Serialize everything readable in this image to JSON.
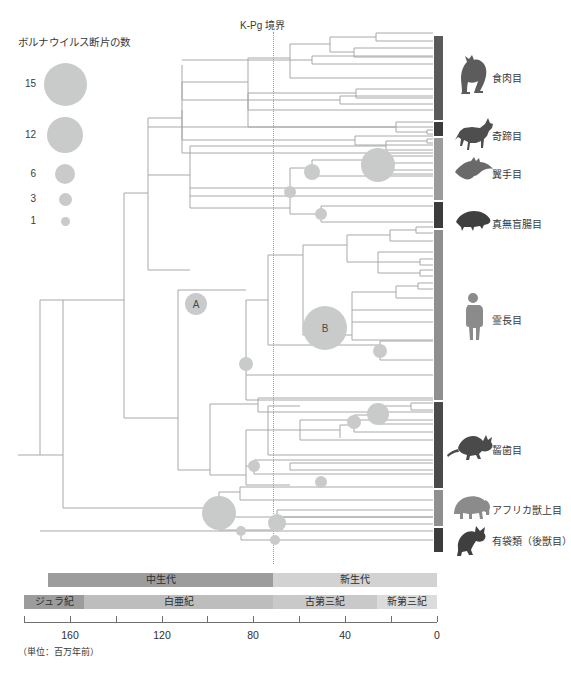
{
  "legend": {
    "title": "ボルナウイルス断片の数",
    "items": [
      {
        "label": "15",
        "value": 15,
        "radius": 21.5,
        "cy": 84
      },
      {
        "label": "12",
        "value": 12,
        "radius": 18.0,
        "cy": 135
      },
      {
        "label": "6",
        "value": 6,
        "radius": 10.0,
        "cy": 174
      },
      {
        "label": "3",
        "value": 3,
        "radius": 6.5,
        "cy": 199
      },
      {
        "label": "1",
        "value": 1,
        "radius": 4.5,
        "cy": 221
      }
    ],
    "bubble_color": "#c9cbca",
    "bubble_cx": 65
  },
  "boundary": {
    "label": "K-Pg 境界",
    "x": 273,
    "color": "#9b9b9b"
  },
  "taxa": [
    {
      "name": "食肉目",
      "bar_top": 36,
      "bar_height": 84,
      "color": "#5a5a5a",
      "label_x": 492,
      "label_y": 76,
      "icon": "cat-icon",
      "icon_x": 458,
      "icon_y": 58
    },
    {
      "name": "奇蹄目",
      "bar_top": 122,
      "bar_height": 14,
      "color": "#3c3c3c",
      "label_x": 492,
      "label_y": 134,
      "icon": "horse-icon",
      "icon_x": 455,
      "icon_y": 124
    },
    {
      "name": "翼手目",
      "bar_top": 138,
      "bar_height": 62,
      "color": "#9b9b9b",
      "label_x": 492,
      "label_y": 172,
      "icon": "bat-icon",
      "icon_x": 455,
      "icon_y": 160
    },
    {
      "name": "真無盲腸目",
      "bar_top": 202,
      "bar_height": 26,
      "color": "#3c3c3c",
      "label_x": 492,
      "label_y": 222,
      "icon": "shrew-icon",
      "icon_x": 455,
      "icon_y": 210
    },
    {
      "name": "霊長目",
      "bar_top": 230,
      "bar_height": 170,
      "color": "#8f8f8f",
      "label_x": 492,
      "label_y": 318,
      "icon": "human-icon",
      "icon_x": 466,
      "icon_y": 292
    },
    {
      "name": "齧歯目",
      "bar_top": 402,
      "bar_height": 86,
      "color": "#4a4a4a",
      "label_x": 492,
      "label_y": 448,
      "icon": "mouse-icon",
      "icon_x": 456,
      "icon_y": 434
    },
    {
      "name": "アフリカ獣上目",
      "bar_top": 490,
      "bar_height": 36,
      "color": "#8f8f8f",
      "label_x": 492,
      "label_y": 508,
      "icon": "elephant-icon",
      "icon_x": 453,
      "icon_y": 494
    },
    {
      "name": "有袋類（後獣目）",
      "bar_top": 528,
      "bar_height": 24,
      "color": "#3c3c3c",
      "label_x": 492,
      "label_y": 539,
      "icon": "koala-icon",
      "icon_x": 456,
      "icon_y": 526
    }
  ],
  "internal_nodes": [
    {
      "label": "A",
      "x": 196,
      "y": 304,
      "r": 11
    },
    {
      "label": "B",
      "x": 325,
      "y": 328,
      "r": 22
    }
  ],
  "timescale": {
    "eras": [
      {
        "name": "中生代",
        "x": 48,
        "width": 225,
        "color": "#9c9c9c"
      },
      {
        "name": "新生代",
        "x": 273,
        "width": 164,
        "color": "#d2d2d2"
      }
    ],
    "periods": [
      {
        "name": "ジュラ紀",
        "x": 24,
        "width": 60,
        "color": "#9c9c9c"
      },
      {
        "name": "白亜紀",
        "x": 84,
        "width": 189,
        "color": "#bdbdbd"
      },
      {
        "name": "古第三紀",
        "x": 273,
        "width": 104,
        "color": "#c9c9c9"
      },
      {
        "name": "新第三紀",
        "x": 377,
        "width": 60,
        "color": "#dcdcdc"
      }
    ],
    "era_row_y": 573,
    "period_row_y": 595
  },
  "axis": {
    "ticks": [
      {
        "value": 180,
        "x": 24,
        "label": ""
      },
      {
        "value": 160,
        "x": 70,
        "label": "160"
      },
      {
        "value": 140,
        "x": 116,
        "label": ""
      },
      {
        "value": 120,
        "x": 162,
        "label": "120"
      },
      {
        "value": 100,
        "x": 207,
        "label": ""
      },
      {
        "value": 80,
        "x": 253,
        "label": "80"
      },
      {
        "value": 60,
        "x": 299,
        "label": ""
      },
      {
        "value": 40,
        "x": 345,
        "label": "40"
      },
      {
        "value": 20,
        "x": 391,
        "label": ""
      },
      {
        "value": 0,
        "x": 437,
        "label": "0"
      }
    ],
    "unit_note": "（単位：百万年前）",
    "range": [
      180,
      0
    ],
    "pixel_range": [
      24,
      437
    ]
  },
  "tree": {
    "line_color": "#a8a8a8",
    "bubble_color": "#c9cbca",
    "root_x": 18,
    "tip_x": 433,
    "bubbles": [
      {
        "x": 312,
        "y": 172,
        "r": 8
      },
      {
        "x": 378,
        "y": 165,
        "r": 17
      },
      {
        "x": 290,
        "y": 192,
        "r": 6
      },
      {
        "x": 321,
        "y": 214,
        "r": 6
      },
      {
        "x": 246,
        "y": 364,
        "r": 7
      },
      {
        "x": 380,
        "y": 351,
        "r": 7
      },
      {
        "x": 378,
        "y": 414,
        "r": 11
      },
      {
        "x": 354,
        "y": 422,
        "r": 7
      },
      {
        "x": 254,
        "y": 466,
        "r": 6
      },
      {
        "x": 321,
        "y": 482,
        "r": 6
      },
      {
        "x": 219,
        "y": 513,
        "r": 17
      },
      {
        "x": 277,
        "y": 523,
        "r": 9
      },
      {
        "x": 241,
        "y": 531,
        "r": 5
      },
      {
        "x": 275,
        "y": 540,
        "r": 5
      }
    ]
  }
}
